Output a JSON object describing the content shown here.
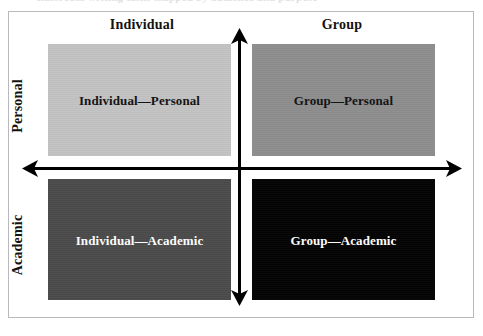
{
  "figure": {
    "caption_sliver": "classroom writing tasks mapped by audience and purpose",
    "border_color": "#b9b9bd",
    "axis_color": "#000000"
  },
  "axes": {
    "horizontal": {
      "name": "audience-axis",
      "left_label": "Individual",
      "right_label": "Group",
      "arrowheads": "both"
    },
    "vertical": {
      "name": "purpose-axis",
      "top_label": "Personal",
      "bottom_label": "Academic",
      "arrowheads": "both"
    }
  },
  "column_headers": [
    {
      "label": "Individual",
      "position": "left"
    },
    {
      "label": "Group",
      "position": "right"
    }
  ],
  "row_headers": [
    {
      "label": "Personal",
      "position": "top"
    },
    {
      "label": "Academic",
      "position": "bottom"
    }
  ],
  "quadrants": [
    {
      "id": "individual-personal",
      "label": "Individual—Personal",
      "position": "top-left",
      "fill": "#c3c3c3",
      "text_color": "#121212"
    },
    {
      "id": "group-personal",
      "label": "Group—Personal",
      "position": "top-right",
      "fill": "#8e8e8e",
      "text_color": "#121212"
    },
    {
      "id": "individual-academic",
      "label": "Individual—Academic",
      "position": "bottom-left",
      "fill": "#4b4b4b",
      "text_color": "#ffffff"
    },
    {
      "id": "group-academic",
      "label": "Group—Academic",
      "position": "bottom-right",
      "fill": "#040404",
      "text_color": "#ffffff"
    }
  ]
}
